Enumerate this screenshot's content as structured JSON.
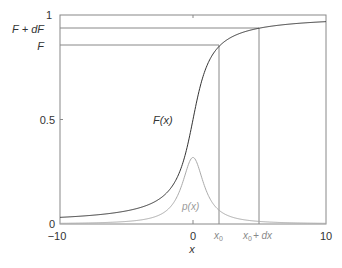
{
  "chart_data": {
    "type": "line",
    "title": "",
    "xlabel": "x",
    "ylabel": "",
    "xlim": [
      -10,
      10
    ],
    "ylim": [
      0,
      1
    ],
    "x_ticks": [
      "-10",
      "0",
      "10"
    ],
    "y_ticks": [
      "0",
      "0.5",
      "1"
    ],
    "y_ref_labels": [
      "F + dF",
      "F"
    ],
    "x_ref_labels": [
      "x0",
      "x0 + dx"
    ],
    "x0": 3,
    "dx": 3,
    "series": [
      {
        "name": "F(x)",
        "description": "Cauchy CDF: 0.5 + atan(x)/pi",
        "color": "#333333"
      },
      {
        "name": "p(x)",
        "description": "Cauchy PDF: 1/(pi(1+x^2)), peak ~0.32 at x=0",
        "color": "#999999"
      }
    ],
    "annotations": [
      "F(x)",
      "p(x)"
    ],
    "grid": false
  },
  "labels": {
    "y1": "1",
    "y05": "0.5",
    "y0": "0",
    "xm10": "−10",
    "x0tick": "0",
    "x10": "10",
    "xlabel": "x",
    "FdF": "F + dF",
    "F": "F",
    "Fx": "F(x)",
    "px": "p(x)",
    "x0": "x",
    "x0sub": "0",
    "x0dx": "x",
    "x0dxsub": "0",
    "x0dxrest": "+ dx"
  }
}
